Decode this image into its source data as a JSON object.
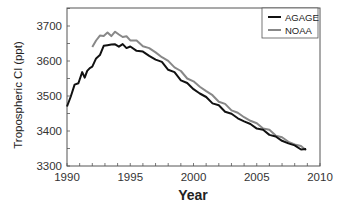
{
  "chart_data": {
    "type": "line",
    "title": "",
    "xlabel": "Year",
    "ylabel": "Tropospheric Cl (ppt)",
    "xlim": [
      1990,
      2010
    ],
    "ylim": [
      3300,
      3750
    ],
    "xticks": [
      1990,
      1995,
      2000,
      2005,
      2010
    ],
    "yticks": [
      3300,
      3400,
      3500,
      3600,
      3700
    ],
    "grid": false,
    "legend_position": "upper right",
    "series": [
      {
        "name": "AGAGE",
        "color": "#111111",
        "x": [
          1990.0,
          1990.3,
          1990.6,
          1990.9,
          1991.2,
          1991.4,
          1991.6,
          1991.8,
          1992.0,
          1992.3,
          1992.6,
          1992.9,
          1993.2,
          1993.5,
          1993.8,
          1994.1,
          1994.4,
          1994.7,
          1995.0,
          1995.5,
          1996.0,
          1996.5,
          1997.0,
          1997.5,
          1998.0,
          1998.5,
          1999.0,
          1999.5,
          2000.0,
          2000.5,
          2001.0,
          2001.5,
          2002.0,
          2002.5,
          2003.0,
          2003.5,
          2004.0,
          2004.5,
          2005.0,
          2005.5,
          2006.0,
          2006.5,
          2007.0,
          2007.5,
          2008.0,
          2008.5,
          2008.9
        ],
        "y": [
          3470,
          3500,
          3530,
          3540,
          3565,
          3555,
          3570,
          3580,
          3585,
          3605,
          3620,
          3640,
          3648,
          3645,
          3648,
          3642,
          3646,
          3640,
          3638,
          3632,
          3625,
          3615,
          3605,
          3595,
          3578,
          3565,
          3548,
          3535,
          3520,
          3508,
          3495,
          3482,
          3470,
          3458,
          3447,
          3437,
          3428,
          3418,
          3410,
          3400,
          3392,
          3382,
          3373,
          3365,
          3357,
          3350,
          3345
        ]
      },
      {
        "name": "NOAA",
        "color": "#888888",
        "x": [
          1992.0,
          1992.3,
          1992.6,
          1992.9,
          1993.2,
          1993.5,
          1993.8,
          1994.1,
          1994.4,
          1994.7,
          1995.0,
          1995.5,
          1996.0,
          1996.5,
          1997.0,
          1997.5,
          1998.0,
          1998.5,
          1999.0,
          1999.5,
          2000.0,
          2000.5,
          2001.0,
          2001.5,
          2002.0,
          2002.5,
          2003.0,
          2003.5,
          2004.0,
          2004.5,
          2005.0,
          2005.5,
          2006.0,
          2006.5,
          2007.0,
          2007.5,
          2008.0,
          2008.5,
          2008.9
        ],
        "y": [
          3640,
          3660,
          3670,
          3675,
          3678,
          3674,
          3682,
          3676,
          3670,
          3668,
          3662,
          3655,
          3645,
          3635,
          3625,
          3612,
          3598,
          3585,
          3568,
          3553,
          3540,
          3527,
          3515,
          3500,
          3487,
          3474,
          3462,
          3450,
          3440,
          3430,
          3420,
          3410,
          3400,
          3390,
          3380,
          3370,
          3362,
          3355,
          3348
        ]
      }
    ]
  },
  "legend": {
    "items": [
      {
        "label": "AGAGE",
        "color": "#111111"
      },
      {
        "label": "NOAA",
        "color": "#888888"
      }
    ]
  },
  "axes": {
    "x_title": "Year",
    "y_title": "Tropospheric Cl (ppt)",
    "x_tick_labels": [
      "1990",
      "1995",
      "2000",
      "2005",
      "2010"
    ],
    "y_tick_labels": [
      "3300",
      "3400",
      "3500",
      "3600",
      "3700"
    ]
  }
}
